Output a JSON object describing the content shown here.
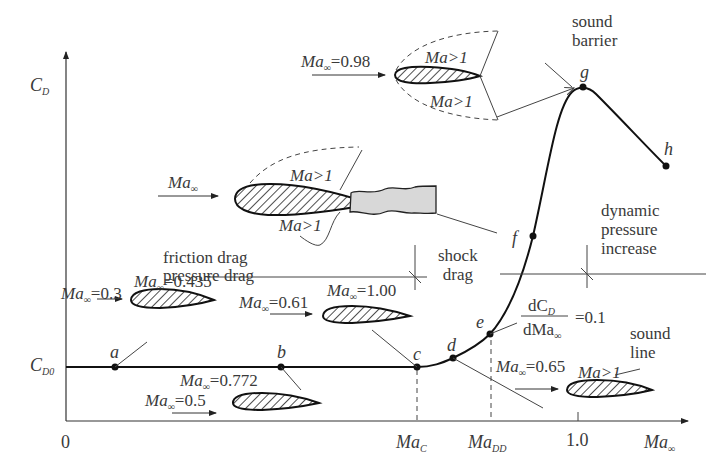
{
  "axes": {
    "y_label": "C",
    "y_label_sub": "D",
    "baseline_label": "C",
    "baseline_label_sub": "D0",
    "origin_label": "0",
    "x_label": "Ma",
    "x_label_sub": "∞",
    "x_ticks": [
      {
        "main": "Ma",
        "sub": "C"
      },
      {
        "main": "Ma",
        "sub": "DD"
      },
      {
        "main": "1.0",
        "sub": ""
      }
    ]
  },
  "points": [
    "a",
    "b",
    "c",
    "d",
    "e",
    "f",
    "g",
    "h"
  ],
  "annotations": {
    "sound_barrier": [
      "sound",
      "barrier"
    ],
    "friction_drag": "friction drag",
    "pressure_drag": "pressure drag",
    "shock_drag": [
      "shock",
      "drag"
    ],
    "dynamic_pressure": [
      "dynamic",
      "pressure",
      "increase"
    ],
    "sound_line": [
      "sound",
      "line"
    ],
    "slope_numerator": "dC",
    "slope_numerator_sub": "D",
    "slope_denominator": "dMa",
    "slope_denominator_sub": "∞",
    "slope_value": "=0.1"
  },
  "airfoils": {
    "top": {
      "mach": "=0.98",
      "regions": [
        "Ma>1",
        "Ma>1"
      ]
    },
    "middle": {
      "mach": "",
      "regions": [
        "Ma>1",
        "Ma>1"
      ]
    },
    "a": {
      "mach_flow": "=0.3",
      "mach_crit": "=0.435"
    },
    "b": {
      "mach_flow": "=0.5",
      "mach_crit": "=0.772"
    },
    "c": {
      "mach_flow": "=0.61",
      "mach_crit": "=1.00"
    },
    "d": {
      "mach_flow": "=0.65",
      "region": "Ma>1"
    }
  },
  "ma_prefix": "Ma",
  "ma_sub": "∞",
  "colors": {
    "line": "#1a1a1a",
    "text": "#3a3a3a",
    "wake": "#d8d8d8"
  }
}
